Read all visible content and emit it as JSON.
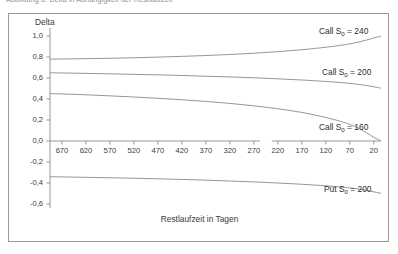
{
  "caption": {
    "text": "Abbildung 8: Delta in Abhängigkeit der Restlaufzeit"
  },
  "chart_data": {
    "type": "line",
    "title": "",
    "xlabel": "Restlaufzeit in Tagen",
    "ylabel": "Delta",
    "x_reversed": true,
    "xlim": [
      695,
      5
    ],
    "ylim": [
      -0.6,
      1.0
    ],
    "grid": false,
    "legend_position": "inline-right",
    "x_ticks": [
      670,
      620,
      570,
      520,
      470,
      420,
      370,
      320,
      270,
      220,
      170,
      120,
      70,
      20
    ],
    "x_tick_labels": [
      "670",
      "620",
      "570",
      "520",
      "470",
      "420",
      "370",
      "320",
      "270",
      "220",
      "170",
      "120",
      "70",
      "20"
    ],
    "y_ticks": [
      1.0,
      0.8,
      0.6,
      0.4,
      0.2,
      0.0,
      -0.2,
      -0.4,
      -0.6
    ],
    "y_tick_labels": [
      "1,0",
      "0,8",
      "0,6",
      "0,4",
      "0,2",
      "0,0",
      "-0,2",
      "-0,4",
      "-0,6"
    ],
    "axis_break": {
      "from_x": 270,
      "to_x": 220
    },
    "series": [
      {
        "name": "Call S0 = 240",
        "label": "Call S",
        "label_sub": "0",
        "label_tail": " = 240",
        "color": "#8a8a8a",
        "x": [
          695,
          670,
          620,
          570,
          520,
          470,
          420,
          370,
          320,
          270,
          220,
          170,
          120,
          90,
          70,
          50,
          35,
          20,
          10,
          5
        ],
        "y": [
          0.78,
          0.781,
          0.784,
          0.788,
          0.793,
          0.799,
          0.806,
          0.814,
          0.824,
          0.836,
          0.851,
          0.869,
          0.893,
          0.911,
          0.925,
          0.944,
          0.962,
          0.981,
          0.993,
          0.999
        ]
      },
      {
        "name": "Call S0 = 200",
        "label": "Call S",
        "label_sub": "0",
        "label_tail": " = 200",
        "color": "#8a8a8a",
        "x": [
          695,
          670,
          620,
          570,
          520,
          470,
          420,
          370,
          320,
          270,
          220,
          170,
          120,
          90,
          70,
          50,
          35,
          20,
          10,
          5
        ],
        "y": [
          0.65,
          0.648,
          0.644,
          0.64,
          0.635,
          0.63,
          0.624,
          0.617,
          0.61,
          0.602,
          0.592,
          0.581,
          0.567,
          0.557,
          0.549,
          0.538,
          0.528,
          0.516,
          0.508,
          0.503
        ]
      },
      {
        "name": "Call S0 = 160",
        "label": "Call S",
        "label_sub": "0",
        "label_tail": " = 160",
        "color": "#8a8a8a",
        "x": [
          695,
          670,
          620,
          570,
          520,
          470,
          420,
          370,
          320,
          270,
          220,
          170,
          120,
          90,
          70,
          50,
          35,
          20,
          10,
          5
        ],
        "y": [
          0.452,
          0.448,
          0.44,
          0.43,
          0.419,
          0.407,
          0.393,
          0.377,
          0.358,
          0.335,
          0.307,
          0.272,
          0.224,
          0.188,
          0.158,
          0.118,
          0.078,
          0.035,
          0.012,
          0.003
        ]
      },
      {
        "name": "Put S0 = 200",
        "label": "Put S",
        "label_sub": "0",
        "label_tail": " = 200",
        "color": "#8a8a8a",
        "x": [
          695,
          670,
          620,
          570,
          520,
          470,
          420,
          370,
          320,
          270,
          220,
          170,
          120,
          90,
          70,
          50,
          35,
          20,
          10,
          5
        ],
        "y": [
          -0.34,
          -0.342,
          -0.346,
          -0.35,
          -0.355,
          -0.36,
          -0.366,
          -0.373,
          -0.381,
          -0.39,
          -0.4,
          -0.412,
          -0.427,
          -0.438,
          -0.447,
          -0.459,
          -0.47,
          -0.484,
          -0.493,
          -0.498
        ]
      }
    ]
  },
  "curve_label_positions": [
    {
      "left": 310,
      "top": 12
    },
    {
      "left": 313,
      "top": 53
    },
    {
      "left": 310,
      "top": 108
    },
    {
      "left": 315,
      "top": 170
    }
  ]
}
